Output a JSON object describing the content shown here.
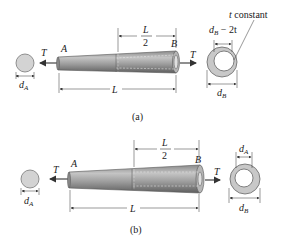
{
  "figures": [
    {
      "id": "a",
      "caption": "(a)",
      "labels": {
        "torque_left": "T",
        "torque_right": "T",
        "end_a": "A",
        "end_b": "B",
        "half_length_num": "L",
        "half_length_den": "2",
        "length": "L",
        "left_section_dim": "d",
        "left_section_sub": "A",
        "right_section_dim": "d",
        "right_section_sub": "B",
        "inner_dim": "d",
        "inner_sub": "B",
        "inner_rest": " − 2t",
        "thickness_note_t": "t",
        "thickness_note": " constant"
      }
    },
    {
      "id": "b",
      "caption": "(b)",
      "labels": {
        "torque_left": "T",
        "torque_right": "T",
        "end_a": "A",
        "end_b": "B",
        "half_length_num": "L",
        "half_length_den": "2",
        "length": "L",
        "left_section_dim": "d",
        "left_section_sub": "A",
        "right_section_dim": "d",
        "right_section_sub": "B",
        "inner_dim": "d",
        "inner_sub": "A"
      }
    }
  ],
  "colors": {
    "shaft_fill": "#a9a9a9",
    "shaft_dark": "#6f6f6f",
    "section_fill": "#d0d0d0",
    "line": "#333333",
    "arrow": "#555555"
  }
}
